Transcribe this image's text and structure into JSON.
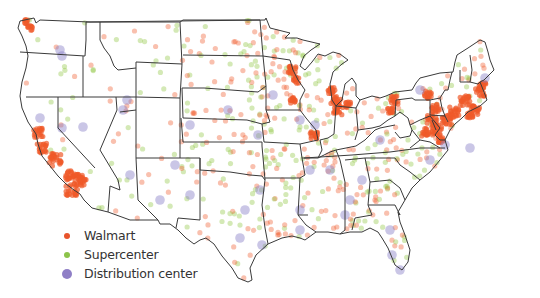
{
  "legend": {
    "items": [
      {
        "label": "Walmart",
        "color": "#e8542c",
        "size": 6
      },
      {
        "label": "Supercenter",
        "color": "#8cc34a",
        "size": 6
      },
      {
        "label": "Distribution center",
        "color": "#8f7fc6",
        "size": 11
      }
    ]
  },
  "colors": {
    "walmart": "#f05a2a",
    "supercenter": "#8dc63f",
    "distribution": "#8a80c8",
    "border": "#3a3a3a"
  },
  "hotspots": {
    "walmart": [
      [
        27,
        22,
        3
      ],
      [
        30,
        28,
        3
      ],
      [
        38,
        133,
        6
      ],
      [
        42,
        148,
        6
      ],
      [
        55,
        160,
        8
      ],
      [
        70,
        175,
        6
      ],
      [
        72,
        190,
        8
      ],
      [
        78,
        178,
        6
      ],
      [
        82,
        183,
        5
      ],
      [
        292,
        70,
        5
      ],
      [
        293,
        100,
        4
      ],
      [
        296,
        80,
        4
      ],
      [
        332,
        90,
        5
      ],
      [
        336,
        102,
        7
      ],
      [
        338,
        110,
        6
      ],
      [
        314,
        135,
        5
      ],
      [
        348,
        105,
        4
      ],
      [
        394,
        100,
        5
      ],
      [
        390,
        110,
        4
      ],
      [
        428,
        95,
        5
      ],
      [
        435,
        108,
        5
      ],
      [
        432,
        120,
        6
      ],
      [
        437,
        130,
        7
      ],
      [
        447,
        120,
        6
      ],
      [
        455,
        112,
        7
      ],
      [
        465,
        100,
        7
      ],
      [
        480,
        92,
        6
      ],
      [
        483,
        86,
        5
      ],
      [
        475,
        110,
        6
      ],
      [
        470,
        115,
        4
      ],
      [
        440,
        140,
        4
      ],
      [
        425,
        132,
        5
      ]
    ],
    "distribution": [
      [
        60,
        50
      ],
      [
        62,
        56
      ],
      [
        40,
        118
      ],
      [
        62,
        128
      ],
      [
        83,
        127
      ],
      [
        127,
        100
      ],
      [
        123,
        110
      ],
      [
        190,
        125
      ],
      [
        228,
        110
      ],
      [
        258,
        135
      ],
      [
        310,
        170
      ],
      [
        260,
        190
      ],
      [
        245,
        210
      ],
      [
        300,
        230
      ],
      [
        350,
        200
      ],
      [
        362,
        180
      ],
      [
        390,
        230
      ],
      [
        420,
        90
      ],
      [
        430,
        160
      ],
      [
        445,
        145
      ],
      [
        380,
        140
      ],
      [
        315,
        125
      ],
      [
        300,
        210
      ],
      [
        330,
        170
      ],
      [
        175,
        165
      ],
      [
        160,
        200
      ],
      [
        190,
        195
      ],
      [
        485,
        78
      ],
      [
        470,
        148
      ],
      [
        400,
        270
      ],
      [
        392,
        255
      ],
      [
        345,
        215
      ],
      [
        240,
        238
      ],
      [
        262,
        245
      ],
      [
        130,
        175
      ],
      [
        273,
        95
      ],
      [
        300,
        120
      ]
    ]
  },
  "seed": 7
}
